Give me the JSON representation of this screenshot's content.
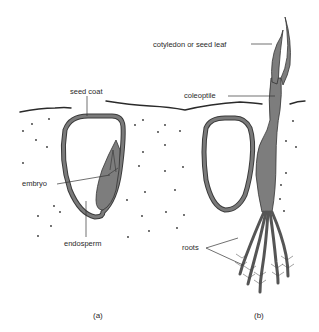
{
  "diagram": {
    "panels": [
      {
        "id": "a",
        "caption": "(a)",
        "labels": {
          "seed_coat": "seed coat",
          "embryo": "embryo",
          "endosperm": "endosperm"
        }
      },
      {
        "id": "b",
        "caption": "(b)",
        "labels": {
          "cotyledon": "cotyledon or seed leaf",
          "coleoptile": "coleoptile",
          "roots": "roots"
        }
      }
    ],
    "colors": {
      "background": "#ffffff",
      "outline": "#333333",
      "tissue": "#7d7d7d"
    }
  }
}
